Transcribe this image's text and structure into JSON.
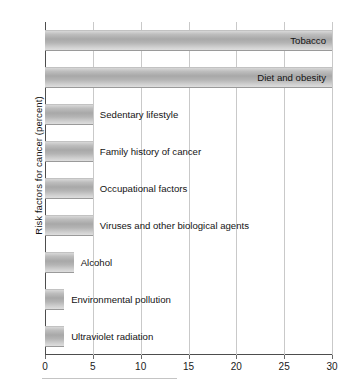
{
  "chart_data": {
    "type": "bar",
    "orientation": "horizontal",
    "title": "",
    "xlabel": "",
    "ylabel": "Risk factors for cancer (percent)",
    "xlim": [
      0,
      30
    ],
    "xticks": [
      0,
      5,
      10,
      15,
      20,
      25,
      30
    ],
    "xtick_labels": [
      "0",
      "5",
      "10",
      "15",
      "20",
      "25",
      "30"
    ],
    "grid": "vertical",
    "legend": "none",
    "bar_color": "#b4b4b4",
    "categories": [
      "Tobacco",
      "Diet and obesity",
      "Sedentary lifestyle",
      "Family history of cancer",
      "Occupational factors",
      "Viruses and other biological agents",
      "Alcohol",
      "Environmental pollution",
      "Ultraviolet radiation"
    ],
    "values": [
      30,
      30,
      5,
      5,
      5,
      5,
      3,
      2,
      2
    ],
    "label_placement": [
      "inside",
      "inside",
      "outside",
      "outside",
      "outside",
      "outside",
      "outside",
      "outside",
      "outside"
    ]
  }
}
